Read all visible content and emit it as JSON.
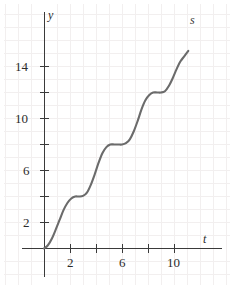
{
  "chart_data": {
    "type": "line",
    "title": "",
    "xlabel": "t",
    "ylabel": "y",
    "curve_label": "s",
    "xlim": [
      -1.7,
      14.2
    ],
    "ylim": [
      -2.5,
      18.5
    ],
    "grid": true,
    "grid_step": 1,
    "legend": "inline-curve-label-top-right",
    "x_ticks": [
      2,
      4,
      6,
      8,
      10
    ],
    "x_tick_labels": [
      "2",
      "",
      "6",
      "",
      "10"
    ],
    "y_ticks": [
      2,
      4,
      6,
      8,
      10,
      12,
      14
    ],
    "y_tick_labels": [
      "2",
      "",
      "6",
      "",
      "10",
      "",
      "14"
    ],
    "series": [
      {
        "name": "s",
        "x": [
          0.0,
          0.3,
          0.6,
          0.9,
          1.2,
          1.5,
          1.8,
          2.1,
          2.4,
          2.7,
          3.0,
          3.3,
          3.6,
          3.9,
          4.2,
          4.5,
          4.8,
          5.1,
          5.4,
          5.7,
          6.0,
          6.3,
          6.6,
          6.9,
          7.2,
          7.5,
          7.8,
          8.1,
          8.4,
          8.7,
          9.0,
          9.3,
          9.6,
          9.9,
          10.2,
          10.5,
          10.8,
          11.1
        ],
        "y": [
          0.0,
          0.25,
          0.75,
          1.45,
          2.2,
          2.95,
          3.5,
          3.85,
          4.0,
          4.0,
          4.05,
          4.3,
          4.9,
          5.7,
          6.6,
          7.35,
          7.8,
          8.0,
          8.0,
          8.0,
          8.0,
          8.1,
          8.4,
          9.0,
          9.8,
          10.7,
          11.4,
          11.8,
          12.0,
          12.0,
          12.0,
          12.1,
          12.5,
          13.1,
          13.8,
          14.4,
          14.8,
          15.2
        ]
      }
    ],
    "plateaus": [
      {
        "y": 4,
        "t_start": 2.3,
        "t_end": 3.1
      },
      {
        "y": 8,
        "t_start": 5.1,
        "t_end": 6.2
      },
      {
        "y": 12,
        "t_start": 8.4,
        "t_end": 9.2
      }
    ]
  },
  "colors": {
    "curve": "#6b6b6b",
    "axis": "#3a3a3a",
    "grid": "#f2efef",
    "text": "#2b2b2b",
    "background": "#ffffff"
  },
  "labels": {
    "y_axis": "y",
    "x_axis": "t",
    "curve": "s",
    "x_2": "2",
    "x_6": "6",
    "x_10": "10",
    "y_2": "2",
    "y_6": "6",
    "y_10": "10",
    "y_14": "14"
  }
}
